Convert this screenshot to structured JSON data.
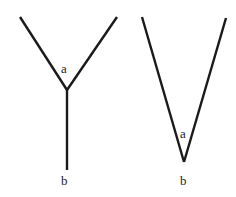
{
  "figures": [
    {
      "name": "y-shape",
      "labels": {
        "top": "a",
        "bottom": "b"
      }
    },
    {
      "name": "v-shape",
      "labels": {
        "top": "a",
        "bottom": "b"
      }
    }
  ],
  "colors": {
    "line": "#1a1a1a",
    "text": "#222222",
    "background": "#ffffff"
  }
}
